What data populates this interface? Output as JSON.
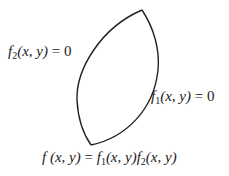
{
  "diagram": {
    "type": "region-bounded-by-two-curves",
    "stroke_color": "#222222",
    "background": "#ffffff",
    "curves": [
      {
        "name": "f2-curve",
        "side": "left",
        "from": [
          142,
          10
        ],
        "to": [
          91,
          145
        ]
      },
      {
        "name": "f1-curve",
        "side": "right",
        "from": [
          142,
          10
        ],
        "to": [
          91,
          145
        ]
      }
    ],
    "labels": {
      "f2": {
        "func": "f",
        "sub": "2",
        "args": "(x, y)",
        "rhs": " = 0"
      },
      "f1": {
        "func": "f",
        "sub": "1",
        "args": "(x, y)",
        "rhs": " = 0"
      },
      "product": {
        "lhs_func": "f",
        "lhs_args": " (x, y)",
        "eq": " = ",
        "t1_func": "f",
        "t1_sub": "1",
        "t1_args": "(x, y)",
        "t2_func": "f",
        "t2_sub": "2",
        "t2_args": "(x, y)"
      }
    }
  }
}
